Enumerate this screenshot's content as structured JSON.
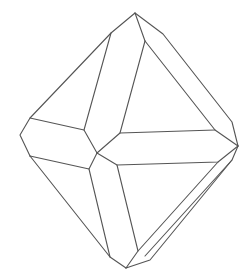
{
  "diagram": {
    "stroke_color": "#555555",
    "background": "#ffffff",
    "stroke_width": 1.1,
    "edges": [
      {
        "name": "outer-upper-left",
        "points": [
          [
            135,
            13
          ],
          [
            111,
            33
          ],
          [
            30,
            118
          ],
          [
            20,
            135
          ],
          [
            30,
            156
          ]
        ]
      },
      {
        "name": "outer-lower-left",
        "points": [
          [
            30,
            156
          ],
          [
            110,
            257
          ],
          [
            126,
            268
          ]
        ]
      },
      {
        "name": "outer-upper-right",
        "points": [
          [
            135,
            13
          ],
          [
            163,
            34
          ],
          [
            232,
            122
          ],
          [
            238,
            146
          ]
        ]
      },
      {
        "name": "outer-lower-right",
        "points": [
          [
            238,
            146
          ],
          [
            232,
            160
          ],
          [
            150,
            260
          ],
          [
            126,
            268
          ]
        ]
      },
      {
        "name": "inner-left-band-top",
        "points": [
          [
            111,
            33
          ],
          [
            84,
            130
          ]
        ]
      },
      {
        "name": "inner-left-band-bottom",
        "points": [
          [
            145,
            41
          ],
          [
            120,
            133
          ]
        ]
      },
      {
        "name": "apex-to-inner",
        "points": [
          [
            135,
            13
          ],
          [
            145,
            41
          ]
        ]
      },
      {
        "name": "inner-right-upper",
        "points": [
          [
            145,
            41
          ],
          [
            215,
            130
          ],
          [
            238,
            146
          ]
        ]
      },
      {
        "name": "left-band-top",
        "points": [
          [
            30,
            118
          ],
          [
            84,
            130
          ],
          [
            97,
            153
          ]
        ]
      },
      {
        "name": "left-band-bottom",
        "points": [
          [
            30,
            156
          ],
          [
            89,
            169
          ],
          [
            97,
            153
          ]
        ]
      },
      {
        "name": "center-to-inner-top",
        "points": [
          [
            97,
            153
          ],
          [
            120,
            133
          ],
          [
            215,
            130
          ]
        ]
      },
      {
        "name": "center-to-inner-bottom",
        "points": [
          [
            97,
            153
          ],
          [
            117,
            165
          ],
          [
            218,
            162
          ],
          [
            238,
            146
          ]
        ]
      },
      {
        "name": "lower-band-left",
        "points": [
          [
            89,
            169
          ],
          [
            110,
            257
          ]
        ]
      },
      {
        "name": "lower-band-right",
        "points": [
          [
            117,
            165
          ],
          [
            138,
            251
          ],
          [
            126,
            268
          ]
        ]
      },
      {
        "name": "lower-right-band",
        "points": [
          [
            218,
            162
          ],
          [
            138,
            251
          ]
        ]
      },
      {
        "name": "lower-right-outer-bevel",
        "points": [
          [
            232,
            160
          ],
          [
            145,
            256
          ]
        ]
      }
    ]
  }
}
